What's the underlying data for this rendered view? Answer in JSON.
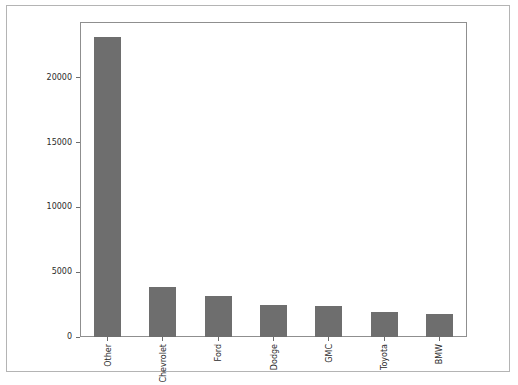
{
  "chart_data": {
    "type": "bar",
    "title": "",
    "subtitle": "",
    "xlabel": "",
    "ylabel": "",
    "categories": [
      "Other",
      "Chevrolet",
      "Ford",
      "Dodge",
      "GMC",
      "Toyota",
      "BMW"
    ],
    "values": [
      23200,
      3850,
      3150,
      2500,
      2400,
      1950,
      1800
    ],
    "series": [
      {
        "name": "count",
        "values": [
          23200,
          3850,
          3150,
          2500,
          2400,
          1950,
          1800
        ]
      }
    ],
    "ylim": [
      0,
      24320
    ],
    "xlim": [
      0,
      7
    ],
    "yticks": [
      0,
      5000,
      10000,
      15000,
      20000
    ],
    "ytick_labels": [
      "0",
      "5000",
      "10000",
      "15000",
      "20000"
    ],
    "xtick_labels": [
      "Other",
      "Chevrolet",
      "Ford",
      "Dodge",
      "GMC",
      "Toyota",
      "BMW"
    ],
    "xtick_rotation": 90,
    "grid": false,
    "legend": false,
    "legend_position": "none",
    "bar_color": "#6e6e6e",
    "background_color": "#ffffff",
    "axis_color": "#8f8f8f",
    "frame_border_color": "#b4b4b4"
  }
}
